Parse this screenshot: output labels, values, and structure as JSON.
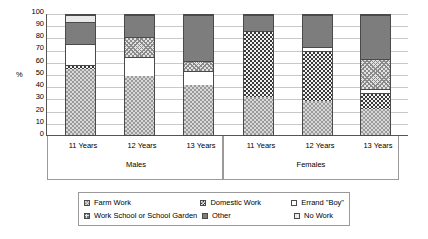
{
  "chart_data": {
    "type": "bar",
    "subtype": "stacked-100",
    "title": "",
    "xlabel": "",
    "ylabel": "%",
    "ylim": [
      0,
      100
    ],
    "ytick_step": 10,
    "yticks": [
      100,
      90,
      80,
      70,
      60,
      50,
      40,
      30,
      20,
      10,
      0
    ],
    "grid": true,
    "legend_position": "bottom",
    "groups": [
      {
        "name": "Males",
        "categories": [
          "11 Years",
          "12 Years",
          "13 Years"
        ]
      },
      {
        "name": "Females",
        "categories": [
          "11 Years",
          "12 Years",
          "13 Years"
        ]
      }
    ],
    "categories": [
      "Males 11 Years",
      "Males 12 Years",
      "Males 13 Years",
      "Females 11 Years",
      "Females 12 Years",
      "Females 13 Years"
    ],
    "series": [
      {
        "name": "Farm Work",
        "values": [
          55,
          49,
          42,
          32,
          28,
          22
        ]
      },
      {
        "name": "Domestic Work",
        "values": [
          3,
          0,
          0,
          55,
          42,
          13
        ]
      },
      {
        "name": "Errand \"Boy\"",
        "values": [
          18,
          16,
          11,
          0,
          3,
          3
        ]
      },
      {
        "name": "Work School or School Garden",
        "values": [
          0,
          17,
          9,
          0,
          0,
          25
        ]
      },
      {
        "name": "Other",
        "values": [
          18,
          18,
          38,
          13,
          27,
          37
        ]
      },
      {
        "name": "No Work",
        "values": [
          6,
          0,
          0,
          0,
          0,
          0
        ]
      }
    ],
    "bars": [
      {
        "label": "11 Years",
        "group": "Males",
        "segments": [
          {
            "series": "Farm Work",
            "from": 0,
            "to": 55
          },
          {
            "series": "Domestic Work",
            "from": 55,
            "to": 58
          },
          {
            "series": "Errand \"Boy\"",
            "from": 58,
            "to": 76
          },
          {
            "series": "Other",
            "from": 76,
            "to": 94
          },
          {
            "series": "No Work",
            "from": 94,
            "to": 100
          }
        ]
      },
      {
        "label": "12 Years",
        "group": "Males",
        "segments": [
          {
            "series": "Farm Work",
            "from": 0,
            "to": 49
          },
          {
            "series": "Errand \"Boy\"",
            "from": 49,
            "to": 65
          },
          {
            "series": "Work School or School Garden",
            "from": 65,
            "to": 82
          },
          {
            "series": "Other",
            "from": 82,
            "to": 100
          }
        ]
      },
      {
        "label": "13 Years",
        "group": "Males",
        "segments": [
          {
            "series": "Farm Work",
            "from": 0,
            "to": 42
          },
          {
            "series": "Errand \"Boy\"",
            "from": 42,
            "to": 53
          },
          {
            "series": "Work School or School Garden",
            "from": 53,
            "to": 62
          },
          {
            "series": "Other",
            "from": 62,
            "to": 100
          }
        ]
      },
      {
        "label": "11 Years",
        "group": "Females",
        "segments": [
          {
            "series": "Farm Work",
            "from": 0,
            "to": 32
          },
          {
            "series": "Domestic Work",
            "from": 32,
            "to": 87
          },
          {
            "series": "Other",
            "from": 87,
            "to": 100
          }
        ]
      },
      {
        "label": "12 Years",
        "group": "Females",
        "segments": [
          {
            "series": "Farm Work",
            "from": 0,
            "to": 28
          },
          {
            "series": "Domestic Work",
            "from": 28,
            "to": 70
          },
          {
            "series": "Errand \"Boy\"",
            "from": 70,
            "to": 73
          },
          {
            "series": "Other",
            "from": 73,
            "to": 100
          }
        ]
      },
      {
        "label": "13 Years",
        "group": "Females",
        "segments": [
          {
            "series": "Farm Work",
            "from": 0,
            "to": 22
          },
          {
            "series": "Domestic Work",
            "from": 22,
            "to": 35
          },
          {
            "series": "Errand \"Boy\"",
            "from": 35,
            "to": 38
          },
          {
            "series": "Work School or School Garden",
            "from": 38,
            "to": 63
          },
          {
            "series": "Other",
            "from": 63,
            "to": 100
          }
        ]
      }
    ],
    "legend": [
      {
        "label": "Farm Work",
        "key": "farm"
      },
      {
        "label": "Domestic Work",
        "key": "domestic"
      },
      {
        "label": "Errand \"Boy\"",
        "key": "errand"
      },
      {
        "label": "Work School or School Garden",
        "key": "workschool"
      },
      {
        "label": "Other",
        "key": "other"
      },
      {
        "label": "No Work",
        "key": "nowork"
      }
    ],
    "colors": {
      "farm": "#d8d8d8",
      "domestic": "#f2f2f2",
      "errand": "#ffffff",
      "workschool": "#e2e2e2",
      "other": "#7d7d7d",
      "nowork": "#e8e8e8",
      "axis": "#555555",
      "grid": "#c9c9c9"
    }
  }
}
